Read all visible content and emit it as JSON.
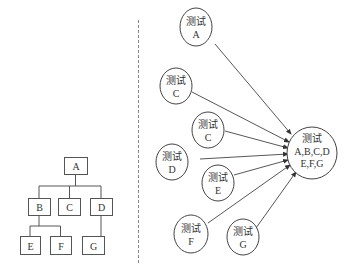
{
  "tree": {
    "nodes": [
      {
        "id": "A",
        "label": "A"
      },
      {
        "id": "B",
        "label": "B"
      },
      {
        "id": "C",
        "label": "C"
      },
      {
        "id": "D",
        "label": "D"
      },
      {
        "id": "E",
        "label": "E"
      },
      {
        "id": "F",
        "label": "F"
      },
      {
        "id": "G",
        "label": "G"
      }
    ],
    "edges": [
      [
        "A",
        "B"
      ],
      [
        "A",
        "C"
      ],
      [
        "A",
        "D"
      ],
      [
        "B",
        "E"
      ],
      [
        "B",
        "F"
      ],
      [
        "D",
        "G"
      ]
    ]
  },
  "graph": {
    "sources": [
      {
        "id": "A",
        "line1": "测试",
        "line2": "A"
      },
      {
        "id": "B",
        "line1": "测试",
        "line2": "B"
      },
      {
        "id": "C",
        "line1": "测试",
        "line2": "C"
      },
      {
        "id": "D",
        "line1": "测试",
        "line2": "D"
      },
      {
        "id": "E",
        "line1": "测试",
        "line2": "E"
      },
      {
        "id": "F",
        "line1": "测试",
        "line2": "F"
      },
      {
        "id": "G",
        "line1": "测试",
        "line2": "G"
      }
    ],
    "target": {
      "line1": "测试",
      "line2": "A,B,C,D",
      "line3": "E,F,G"
    }
  }
}
